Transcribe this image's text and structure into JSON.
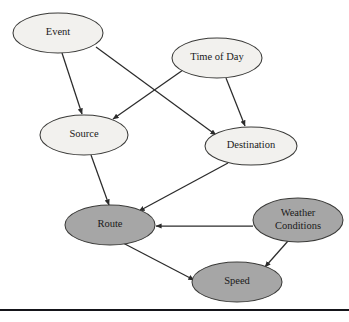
{
  "figure": {
    "background_color": "#ffffff",
    "width": 349,
    "height": 322
  },
  "palette": {
    "node_light_fill": "#f2f1ee",
    "node_shaded_fill": "#a6a6a6",
    "node_stroke": "#3a3a38",
    "edge_color": "#2b2b2b",
    "text_color": "#1a1a1a",
    "rule_color": "#15151a"
  },
  "nodes": [
    {
      "id": "event",
      "label": "Event",
      "shading": "light",
      "fill": "#f2f1ee",
      "cx": 58,
      "cy": 33,
      "rx": 45,
      "ry": 20,
      "font_size": 10.5,
      "lines": [
        "Event"
      ]
    },
    {
      "id": "time_of_day",
      "label": "Time of Day",
      "shading": "light",
      "fill": "#f2f1ee",
      "cx": 217,
      "cy": 58,
      "rx": 45,
      "ry": 20,
      "font_size": 10.5,
      "lines": [
        "Time of Day"
      ]
    },
    {
      "id": "source",
      "label": "Source",
      "shading": "light",
      "fill": "#f2f1ee",
      "cx": 84,
      "cy": 135,
      "rx": 44,
      "ry": 20,
      "font_size": 10.5,
      "lines": [
        "Source"
      ]
    },
    {
      "id": "destination",
      "label": "Destination",
      "shading": "light",
      "fill": "#f2f1ee",
      "cx": 251,
      "cy": 146,
      "rx": 46,
      "ry": 19,
      "font_size": 10.5,
      "lines": [
        "Destination"
      ]
    },
    {
      "id": "route",
      "label": "Route",
      "shading": "shaded",
      "fill": "#a6a6a6",
      "cx": 110,
      "cy": 225,
      "rx": 45,
      "ry": 20,
      "font_size": 10.5,
      "lines": [
        "Route"
      ]
    },
    {
      "id": "weather_conditions",
      "label": "Weather Conditions",
      "shading": "shaded",
      "fill": "#a6a6a6",
      "cx": 298,
      "cy": 220,
      "rx": 45,
      "ry": 22,
      "font_size": 10.5,
      "lines": [
        "Weather",
        "Conditions"
      ]
    },
    {
      "id": "speed",
      "label": "Speed",
      "shading": "shaded",
      "fill": "#a6a6a6",
      "cx": 237,
      "cy": 282,
      "rx": 45,
      "ry": 20,
      "font_size": 10.5,
      "lines": [
        "Speed"
      ]
    }
  ],
  "edges": [
    {
      "id": "event-source",
      "from": "Event",
      "to": "Source",
      "x1": 62,
      "y1": 53,
      "x2": 82,
      "y2": 114
    },
    {
      "id": "event-destination",
      "from": "Event",
      "to": "Destination",
      "x1": 96,
      "y1": 47,
      "x2": 216,
      "y2": 135
    },
    {
      "id": "timeofday-source",
      "from": "Time of Day",
      "to": "Source",
      "x1": 183,
      "y1": 70,
      "x2": 113,
      "y2": 119
    },
    {
      "id": "timeofday-destination",
      "from": "Time of Day",
      "to": "Destination",
      "x1": 226,
      "y1": 78,
      "x2": 245,
      "y2": 126
    },
    {
      "id": "source-route",
      "from": "Source",
      "to": "Route",
      "x1": 91,
      "y1": 155,
      "x2": 109,
      "y2": 205
    },
    {
      "id": "destination-route",
      "from": "Destination",
      "to": "Route",
      "x1": 228,
      "y1": 163,
      "x2": 139,
      "y2": 211
    },
    {
      "id": "weather-route",
      "from": "Weather Conditions",
      "to": "Route",
      "x1": 253,
      "y1": 226,
      "x2": 156,
      "y2": 226
    },
    {
      "id": "route-speed",
      "from": "Route",
      "to": "Speed",
      "x1": 123,
      "y1": 243,
      "x2": 194,
      "y2": 280
    },
    {
      "id": "weather-speed",
      "from": "Weather Conditions",
      "to": "Speed",
      "x1": 288,
      "y1": 241,
      "x2": 265,
      "y2": 267
    }
  ],
  "rule": {
    "id": "bottom-rule",
    "x1": 0,
    "y1": 310,
    "x2": 349,
    "y2": 310
  }
}
